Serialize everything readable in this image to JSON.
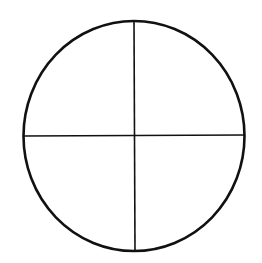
{
  "diagram": {
    "type": "quartered-circle",
    "background": "#ffffff",
    "stroke_color": "#111111",
    "circle": {
      "cx": 134,
      "cy": 136,
      "rx": 110.5,
      "ry": 115,
      "stroke_width": 2.6
    },
    "lines": {
      "horizontal": {
        "x1": 23.5,
        "y1": 136,
        "x2": 244.5,
        "y2": 135,
        "stroke_width": 1.6
      },
      "vertical": {
        "x1": 134,
        "y1": 21,
        "x2": 135,
        "y2": 251,
        "stroke_width": 1.6
      }
    },
    "quadrants": [
      "top-left",
      "top-right",
      "bottom-left",
      "bottom-right"
    ]
  }
}
